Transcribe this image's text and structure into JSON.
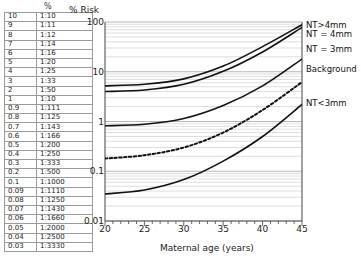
{
  "table": {
    "header": "%",
    "columns": [
      "percent",
      "ratio"
    ],
    "rows": [
      [
        "10",
        "1:10"
      ],
      [
        "9",
        "1:11"
      ],
      [
        "8",
        "1:12"
      ],
      [
        "7",
        "1:14"
      ],
      [
        "6",
        "1:16"
      ],
      [
        "5",
        "1:20"
      ],
      [
        "4",
        "1:25"
      ],
      [
        "3",
        "1:33"
      ],
      [
        "2",
        "1:50"
      ],
      [
        "1",
        "1:10"
      ],
      [
        "0.9",
        "1:111"
      ],
      [
        "0.8",
        "1:125"
      ],
      [
        "0.7",
        "1:143"
      ],
      [
        "0.6",
        "1:166"
      ],
      [
        "0.5",
        "1:200"
      ],
      [
        "0.4",
        "1:250"
      ],
      [
        "0.3",
        "1:333"
      ],
      [
        "0.2",
        "1:500"
      ],
      [
        "0.1",
        "1:1000"
      ],
      [
        "0.09",
        "1:1110"
      ],
      [
        "0.08",
        "1:1250"
      ],
      [
        "0.07",
        "1:1430"
      ],
      [
        "0.06",
        "1:1660"
      ],
      [
        "0.05",
        "1:2000"
      ],
      [
        "0.04",
        "1:2500"
      ],
      [
        "0.03",
        "1:3330"
      ]
    ]
  },
  "chart_data": {
    "type": "line",
    "title": "",
    "xlabel": "Maternal age (years)",
    "ylabel": "% Risk",
    "xlim": [
      20,
      45
    ],
    "ylim": [
      0.01,
      100
    ],
    "yscale": "log",
    "grid": true,
    "xticks": [
      "20",
      "25",
      "30",
      "35",
      "40",
      "45"
    ],
    "yticks": [
      "100",
      "10",
      "1",
      "0.1",
      "0.01"
    ],
    "x": [
      20,
      25,
      30,
      35,
      40,
      45
    ],
    "series": [
      {
        "name": "NT>4mm",
        "style": "solid",
        "values": [
          5.2,
          5.6,
          7.2,
          13.0,
          32.0,
          88.0
        ]
      },
      {
        "name": "NT = 4mm",
        "style": "solid",
        "values": [
          4.0,
          4.3,
          5.6,
          10.2,
          25.0,
          78.0
        ]
      },
      {
        "name": "NT = 3mm",
        "style": "solid",
        "values": [
          0.82,
          0.88,
          1.15,
          2.1,
          5.2,
          18.0
        ]
      },
      {
        "name": "Background",
        "style": "dashed",
        "values": [
          0.18,
          0.21,
          0.3,
          0.6,
          1.7,
          6.2
        ]
      },
      {
        "name": "NT<3mm",
        "style": "solid",
        "values": [
          0.035,
          0.042,
          0.068,
          0.16,
          0.5,
          2.2
        ]
      }
    ],
    "legend_position": "right-inline"
  }
}
